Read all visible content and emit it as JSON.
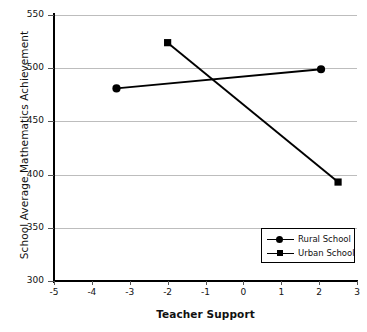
{
  "chart_data": {
    "type": "line",
    "title": "",
    "xlabel": "Teacher Support",
    "ylabel": "School Average Mathematics Achievement",
    "xlim": [
      -5,
      3
    ],
    "ylim": [
      300,
      550
    ],
    "xticks": [
      "-5",
      "-4",
      "-3",
      "-2",
      "-1",
      "0",
      "1",
      "2",
      "3"
    ],
    "xtick_values": [
      -5,
      -4,
      -3,
      -2,
      -1,
      0,
      1,
      2,
      3
    ],
    "yticks": [
      "300",
      "350",
      "400",
      "450",
      "500",
      "550"
    ],
    "ytick_values": [
      300,
      350,
      400,
      450,
      500,
      550
    ],
    "grid": "horizontal",
    "legend_position": "lower-right",
    "series": [
      {
        "name": "Rural School",
        "marker": "circle",
        "color": "#000000",
        "points": [
          {
            "x": -3.35,
            "y": 481
          },
          {
            "x": 2.05,
            "y": 499
          }
        ]
      },
      {
        "name": "Urban School",
        "marker": "square",
        "color": "#000000",
        "points": [
          {
            "x": -2.0,
            "y": 524
          },
          {
            "x": 2.5,
            "y": 393
          }
        ]
      }
    ]
  },
  "legend": {
    "items": [
      {
        "label": "Rural School",
        "marker": "circle-marker-icon"
      },
      {
        "label": "Urban School",
        "marker": "square-marker-icon"
      }
    ]
  }
}
